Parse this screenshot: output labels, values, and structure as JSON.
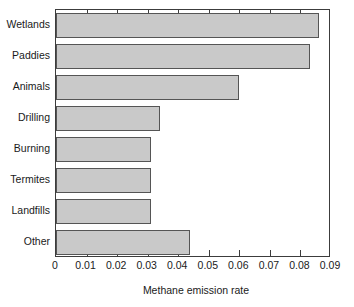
{
  "chart_data": {
    "type": "bar",
    "orientation": "horizontal",
    "title": "",
    "xlabel": "Methane emission rate",
    "ylabel": "",
    "categories": [
      "Wetlands",
      "Paddies",
      "Animals",
      "Drilling",
      "Burning",
      "Termites",
      "Landfills",
      "Other"
    ],
    "values": [
      0.086,
      0.083,
      0.06,
      0.034,
      0.031,
      0.031,
      0.031,
      0.044
    ],
    "xlim": [
      0,
      0.09
    ],
    "ylim": [
      0,
      8
    ],
    "xticks": [
      "0",
      "0.01",
      "0.02",
      "0.03",
      "0.04",
      "0.05",
      "0.06",
      "0.07",
      "0.08",
      "0.09"
    ],
    "xtick_values": [
      0,
      0.01,
      0.02,
      0.03,
      0.04,
      0.05,
      0.06,
      0.07,
      0.08,
      0.09
    ],
    "grid": false,
    "legend": false,
    "bar_fill_color": "#c9c9c9",
    "bar_edge_color": "#555555",
    "axis_color": "#3c3c3c",
    "background_color": "#ffffff"
  },
  "axis": {
    "x_title": "Methane emission rate"
  }
}
